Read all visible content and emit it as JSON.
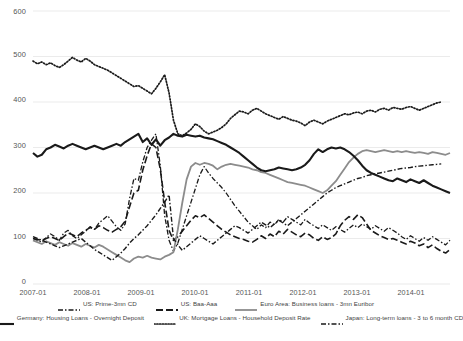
{
  "chart_data": {
    "type": "line",
    "title": "",
    "subtitle": "",
    "xlabel": "",
    "ylabel": "",
    "ylim": [
      0,
      600
    ],
    "yticks": [
      0,
      100,
      200,
      300,
      400,
      500,
      600
    ],
    "xticks": [
      "2007-01",
      "2008-01",
      "2009-01",
      "2010-01",
      "2011-01",
      "2012-01",
      "2013-01",
      "2014-01"
    ],
    "grid": true,
    "legend_position": "bottom",
    "x_start": "2007-01",
    "x_end": "2014-12",
    "x_step_months": 1,
    "series": [
      {
        "name": "US: Prime-3mn CD",
        "style": "dash-dot",
        "color": "#1a1a1a",
        "width": 1.3,
        "values": [
          100,
          96,
          92,
          102,
          110,
          104,
          96,
          112,
          118,
          106,
          100,
          108,
          116,
          126,
          120,
          134,
          142,
          150,
          138,
          126,
          118,
          132,
          188,
          232,
          228,
          268,
          300,
          316,
          330,
          260,
          150,
          96,
          72,
          90,
          120,
          150,
          180,
          210,
          240,
          258,
          244,
          232,
          222,
          212,
          200,
          186,
          172,
          160,
          148,
          136,
          128,
          120,
          130,
          124,
          136,
          130,
          142,
          136,
          148,
          142,
          136,
          130,
          142,
          134,
          128,
          122,
          130,
          124,
          118,
          126,
          120,
          114,
          122,
          130,
          124,
          132,
          126,
          120,
          128,
          122,
          116,
          124,
          118,
          112,
          104,
          98,
          106,
          100,
          94,
          102,
          96,
          104,
          98,
          92,
          86,
          96
        ]
      },
      {
        "name": "US: Baa-Aaa",
        "style": "dashed",
        "color": "#1a1a1a",
        "width": 1.6,
        "values": [
          100,
          98,
          96,
          100,
          104,
          100,
          96,
          104,
          112,
          108,
          104,
          112,
          118,
          124,
          120,
          128,
          124,
          118,
          114,
          120,
          126,
          138,
          170,
          200,
          206,
          250,
          282,
          308,
          300,
          252,
          180,
          118,
          96,
          104,
          116,
          128,
          140,
          150,
          146,
          152,
          144,
          136,
          128,
          120,
          114,
          108,
          104,
          100,
          98,
          94,
          92,
          98,
          106,
          100,
          110,
          104,
          116,
          110,
          120,
          114,
          108,
          104,
          112,
          108,
          100,
          96,
          104,
          98,
          102,
          110,
          128,
          140,
          148,
          142,
          152,
          146,
          132,
          118,
          112,
          106,
          102,
          98,
          100,
          96,
          92,
          88,
          94,
          90,
          84,
          88,
          80,
          86,
          78,
          72,
          68,
          76
        ]
      },
      {
        "name": "Euro Area: Business loans - 3mn Euribor",
        "style": "solid",
        "color": "#8c8c8c",
        "width": 1.8,
        "values": [
          96,
          92,
          88,
          94,
          90,
          86,
          92,
          88,
          84,
          90,
          86,
          82,
          88,
          84,
          80,
          86,
          82,
          76,
          70,
          64,
          58,
          52,
          48,
          56,
          60,
          58,
          62,
          58,
          56,
          54,
          60,
          64,
          70,
          120,
          178,
          230,
          258,
          266,
          262,
          266,
          264,
          260,
          252,
          258,
          262,
          264,
          262,
          260,
          258,
          256,
          252,
          250,
          246,
          244,
          240,
          236,
          232,
          228,
          224,
          222,
          220,
          218,
          216,
          212,
          208,
          204,
          200,
          206,
          216,
          226,
          240,
          254,
          268,
          278,
          286,
          292,
          294,
          292,
          290,
          292,
          294,
          292,
          290,
          292,
          290,
          292,
          290,
          288,
          290,
          288,
          286,
          290,
          288,
          286,
          284,
          288
        ]
      },
      {
        "name": "Germany: Housing Loans - Overnight Deposit",
        "style": "solid",
        "color": "#1a1a1a",
        "width": 2.1,
        "values": [
          288,
          280,
          284,
          296,
          300,
          306,
          302,
          298,
          304,
          308,
          304,
          300,
          296,
          300,
          304,
          300,
          296,
          300,
          304,
          308,
          304,
          312,
          318,
          324,
          330,
          312,
          320,
          306,
          318,
          304,
          316,
          322,
          330,
          326,
          324,
          328,
          326,
          324,
          326,
          322,
          320,
          318,
          314,
          310,
          306,
          300,
          294,
          288,
          280,
          272,
          264,
          256,
          250,
          248,
          250,
          252,
          256,
          254,
          252,
          250,
          252,
          256,
          262,
          272,
          286,
          296,
          290,
          296,
          300,
          298,
          300,
          296,
          290,
          282,
          272,
          260,
          250,
          244,
          240,
          236,
          232,
          228,
          226,
          232,
          228,
          224,
          230,
          226,
          222,
          228,
          222,
          216,
          212,
          208,
          204,
          200
        ]
      },
      {
        "name": "UK: Mortgage Loans - Household Deposit Rate",
        "style": "dotted",
        "color": "#1a1a1a",
        "width": 1.7,
        "values": [
          490,
          484,
          488,
          482,
          486,
          480,
          476,
          482,
          490,
          498,
          492,
          488,
          496,
          490,
          482,
          478,
          474,
          470,
          464,
          458,
          452,
          446,
          440,
          434,
          436,
          430,
          424,
          418,
          430,
          444,
          460,
          420,
          360,
          330,
          326,
          332,
          340,
          352,
          346,
          336,
          330,
          334,
          338,
          344,
          352,
          364,
          372,
          380,
          378,
          374,
          382,
          386,
          380,
          374,
          370,
          366,
          362,
          368,
          364,
          360,
          358,
          354,
          348,
          356,
          360,
          356,
          352,
          358,
          362,
          366,
          370,
          374,
          372,
          376,
          378,
          374,
          380,
          382,
          378,
          384,
          386,
          382,
          388,
          386,
          384,
          388,
          390,
          386,
          382,
          386,
          390,
          394,
          398,
          400
        ]
      },
      {
        "name": "Japan: Long-term loans - 3 to 6 month CD",
        "style": "dash-dot",
        "color": "#1a1a1a",
        "width": 1.4,
        "values": [
          104,
          100,
          96,
          92,
          88,
          84,
          80,
          84,
          88,
          92,
          96,
          100,
          92,
          84,
          76,
          70,
          64,
          58,
          52,
          60,
          68,
          78,
          90,
          100,
          108,
          118,
          128,
          140,
          152,
          166,
          180,
          196,
          100,
          86,
          74,
          82,
          90,
          98,
          106,
          100,
          94,
          88,
          96,
          104,
          112,
          120,
          128,
          124,
          118,
          112,
          120,
          128,
          136,
          130,
          124,
          132,
          140,
          134,
          128,
          136,
          144,
          152,
          160,
          168,
          176,
          184,
          192,
          200,
          206,
          212,
          216,
          220,
          224,
          228,
          232,
          234,
          238,
          240,
          242,
          244,
          246,
          248,
          250,
          252,
          254,
          255,
          256,
          258,
          259,
          260,
          261,
          262,
          263,
          264
        ]
      }
    ]
  },
  "legend": {
    "items": [
      {
        "label": "US: Prime-3mn CD",
        "style": "dash-dot"
      },
      {
        "label": "US: Baa-Aaa",
        "style": "dashed"
      },
      {
        "label": "Euro Area: Business loans - 3mn Euribor",
        "style": "solid-gray"
      },
      {
        "label": "Germany: Housing Loans - Overnight Deposit",
        "style": "solid-black"
      },
      {
        "label": "UK: Mortgage Loans - Household Deposit Rate",
        "style": "dotted"
      },
      {
        "label": "Japan: Long-term loans - 3 to 6 month CD",
        "style": "dash-dot"
      }
    ]
  },
  "axes": {
    "y_labels": [
      "600",
      "500",
      "400",
      "300",
      "200",
      "100",
      "0"
    ],
    "x_labels": [
      "2007-01",
      "2008-01",
      "2009-01",
      "2010-01",
      "2011-01",
      "2012-01",
      "2013-01",
      "2014-01"
    ]
  },
  "colors": {
    "gridline": "#e9e9e9",
    "black_series": "#1a1a1a",
    "gray_series": "#8c8c8c",
    "tick_text": "#555555"
  }
}
